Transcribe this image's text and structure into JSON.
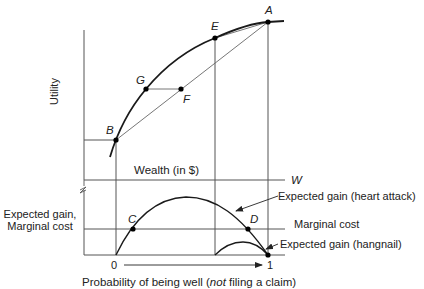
{
  "diagram": {
    "type": "economics-figure",
    "upper_panel": {
      "y_axis_label": "Utility",
      "x_axis_label": "Wealth (in $)",
      "x_axis_end_label": "W",
      "points": {
        "A": "A",
        "B": "B",
        "E": "E",
        "F": "F",
        "G": "G"
      }
    },
    "lower_panel": {
      "y_axis_label_line1": "Expected gain,",
      "y_axis_label_line2": "Marginal cost",
      "x_axis_label_prefix": "Probability of being well (",
      "x_axis_label_italic": "not",
      "x_axis_label_suffix": " filing a claim)",
      "x_start": "0",
      "x_end": "1",
      "points": {
        "C": "C",
        "D": "D"
      },
      "annotations": {
        "heart_attack": "Expected gain (heart attack)",
        "marginal_cost": "Marginal cost",
        "hangnail": "Expected gain (hangnail)"
      }
    },
    "colors": {
      "curve": "#1a1a1a",
      "line": "#555555",
      "point": "#000000"
    }
  }
}
